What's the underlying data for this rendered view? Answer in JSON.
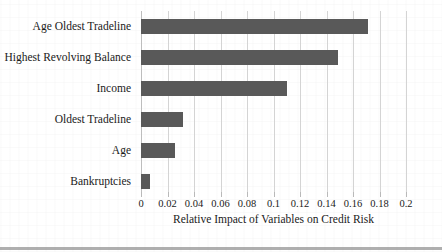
{
  "chart_data": {
    "type": "bar",
    "orientation": "horizontal",
    "title": "",
    "xlabel": "Relative Impact of Variables on Credit Risk",
    "ylabel": "",
    "categories": [
      "Age Oldest Tradeline",
      "Highest Revolving Balance",
      "Income",
      "Oldest Tradeline",
      "Age",
      "Bankruptcies"
    ],
    "values": [
      0.171,
      0.149,
      0.11,
      0.032,
      0.026,
      0.007
    ],
    "xlim": [
      0,
      0.2
    ],
    "xticks": [
      "0",
      "0.02",
      "0.04",
      "0.06",
      "0.08",
      "0.1",
      "0.12",
      "0.14",
      "0.16",
      "0.18",
      "0.2"
    ],
    "xtick_values": [
      0,
      0.02,
      0.04,
      0.06,
      0.08,
      0.1,
      0.12,
      0.14,
      0.16,
      0.18,
      0.2
    ],
    "grid": "vertical",
    "legend": null,
    "bar_color": "#595959",
    "gridline_color": "#d4d4d4"
  }
}
